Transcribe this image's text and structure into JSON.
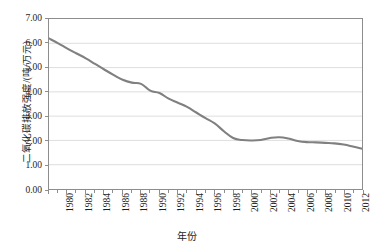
{
  "chart_data": {
    "type": "line",
    "title": "",
    "xlabel": "年份",
    "ylabel": "二氧化碳排放强度/(吨/万元)",
    "xlim": [
      1980,
      2014
    ],
    "ylim": [
      0.0,
      7.0
    ],
    "ytick_step": 1.0,
    "grid": true,
    "grid_axis": "y",
    "legend": "none",
    "line_color": "#808080",
    "x": [
      1980,
      1981,
      1982,
      1983,
      1984,
      1985,
      1986,
      1987,
      1988,
      1989,
      1990,
      1991,
      1992,
      1993,
      1994,
      1995,
      1996,
      1997,
      1998,
      1999,
      2000,
      2001,
      2002,
      2003,
      2004,
      2005,
      2006,
      2007,
      2008,
      2009,
      2010,
      2011,
      2012,
      2013,
      2014
    ],
    "values": [
      6.2,
      6.0,
      5.78,
      5.58,
      5.38,
      5.15,
      4.92,
      4.7,
      4.5,
      4.38,
      4.33,
      4.05,
      3.95,
      3.72,
      3.55,
      3.38,
      3.15,
      2.92,
      2.7,
      2.38,
      2.1,
      2.02,
      2.0,
      2.02,
      2.1,
      2.13,
      2.08,
      1.98,
      1.93,
      1.92,
      1.9,
      1.88,
      1.83,
      1.75,
      1.66
    ],
    "ytick_labels": [
      "0.00",
      "1.00",
      "2.00",
      "3.00",
      "4.00",
      "5.00",
      "6.00",
      "7.00"
    ],
    "ytick_values": [
      0.0,
      1.0,
      2.0,
      3.0,
      4.0,
      5.0,
      6.0,
      7.0
    ],
    "xtick_labels": [
      "1980",
      "1982",
      "1984",
      "1986",
      "1988",
      "1990",
      "1992",
      "1994",
      "1996",
      "1998",
      "2000",
      "2002",
      "2004",
      "2006",
      "2008",
      "2010",
      "2012",
      "2014"
    ],
    "xtick_values": [
      1980,
      1982,
      1984,
      1986,
      1988,
      1990,
      1992,
      1994,
      1996,
      1998,
      2000,
      2002,
      2004,
      2006,
      2008,
      2010,
      2012,
      2014
    ],
    "minor_xticks": [
      1980,
      1981,
      1982,
      1983,
      1984,
      1985,
      1986,
      1987,
      1988,
      1989,
      1990,
      1991,
      1992,
      1993,
      1994,
      1995,
      1996,
      1997,
      1998,
      1999,
      2000,
      2001,
      2002,
      2003,
      2004,
      2005,
      2006,
      2007,
      2008,
      2009,
      2010,
      2011,
      2012,
      2013,
      2014
    ]
  }
}
